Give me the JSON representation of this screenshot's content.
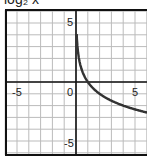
{
  "chart_data": {
    "type": "line",
    "title": "log₂ x",
    "function": "y = -log2(x)",
    "xlabel": "",
    "ylabel": "",
    "xlim": [
      -6,
      6
    ],
    "ylim": [
      -6,
      6
    ],
    "grid": true,
    "x_tick_labels": [
      "-5",
      "0",
      "5"
    ],
    "y_tick_labels": [
      "5",
      "-5"
    ],
    "series": [
      {
        "name": "curve",
        "color": "#333333",
        "x": [
          0.0625,
          0.125,
          0.25,
          0.5,
          1,
          2,
          3,
          4,
          5,
          6
        ],
        "y": [
          4,
          3,
          2,
          1,
          0,
          -1,
          -1.58,
          -2,
          -2.32,
          -2.58
        ]
      }
    ]
  },
  "ticks": {
    "x_neg5": "-5",
    "x_0": "0",
    "x_5": "5",
    "y_5": "5",
    "y_neg5": "-5"
  }
}
